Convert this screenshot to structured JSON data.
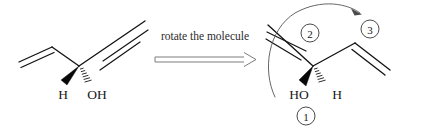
{
  "diagram": {
    "background_color": "#ffffff",
    "ink_color": "#131313",
    "accent_gray": "#6d6d6d",
    "caption": {
      "text": "rotate the molecule",
      "arrow": "double-line-right-arrow"
    },
    "left_molecule": {
      "name": "pent-1-en-4-yn-3-ol",
      "substituent_labels": [
        {
          "text": "H",
          "bond_style": "solid-wedge",
          "position": "down-left"
        },
        {
          "text": "OH",
          "bond_style": "hashed-wedge",
          "position": "down-right"
        }
      ],
      "groups": [
        {
          "name": "vinyl",
          "bond": "double",
          "direction": "left"
        },
        {
          "name": "alkynyl",
          "bond": "triple",
          "direction": "upper-right"
        }
      ]
    },
    "right_molecule": {
      "name": "pent-1-en-4-yn-3-ol rotated",
      "substituent_labels": [
        {
          "text": "HO",
          "bond_style": "solid-wedge",
          "position": "down-left"
        },
        {
          "text": "H",
          "bond_style": "hashed-wedge",
          "position": "down-right"
        }
      ],
      "groups": [
        {
          "name": "alkynyl",
          "bond": "triple",
          "direction": "upper-left"
        },
        {
          "name": "vinyl",
          "bond": "double",
          "direction": "right"
        }
      ],
      "priority_numbers": [
        {
          "label": "1",
          "position": "below-HO",
          "refers_to": "hydroxyl"
        },
        {
          "label": "2",
          "position": "upper-left",
          "refers_to": "alkynyl"
        },
        {
          "label": "3",
          "position": "upper-right",
          "refers_to": "vinyl"
        }
      ],
      "rotation_arc": {
        "style": "curved-arrow",
        "direction": "counterclockwise-sweep",
        "head": "upper-right"
      }
    }
  }
}
